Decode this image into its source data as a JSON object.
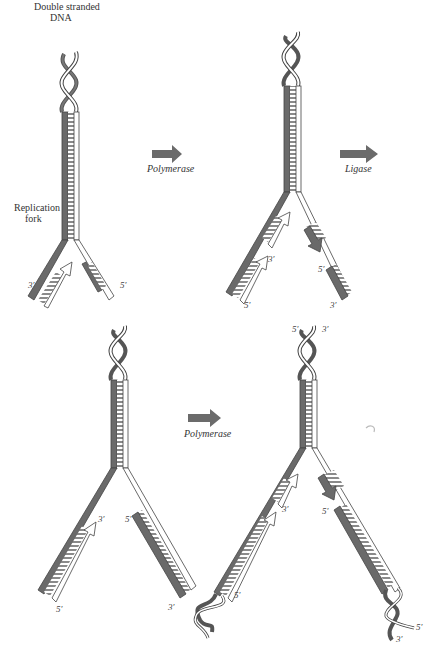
{
  "figure": {
    "title_label": {
      "line1": "Double stranded",
      "line2": "DNA"
    },
    "fork_label": {
      "line1": "Replication",
      "line2": "fork"
    },
    "steps": [
      {
        "arrow_label": "Polymerase"
      },
      {
        "arrow_label": "Ligase"
      },
      {
        "arrow_label": "Polymerase"
      }
    ],
    "panels": [
      {
        "id": "panel-1",
        "end_labels": [
          "3′",
          "5′"
        ]
      },
      {
        "id": "panel-2",
        "end_labels": [
          "3′",
          "5′",
          "5′",
          "3′"
        ]
      },
      {
        "id": "panel-3",
        "end_labels": [
          "3′",
          "5′",
          "5′",
          "3′"
        ]
      },
      {
        "id": "panel-4",
        "end_labels": [
          "5′",
          "3′",
          "3′",
          "5′",
          "5′",
          "5′",
          "3′"
        ]
      }
    ]
  },
  "colors": {
    "dark_strand": "#6a6a6a",
    "light_strand": "#ffffff",
    "outline": "#444444",
    "rung": "#888888",
    "arrow_fill": "#6b6b6b",
    "label": "#333333"
  }
}
